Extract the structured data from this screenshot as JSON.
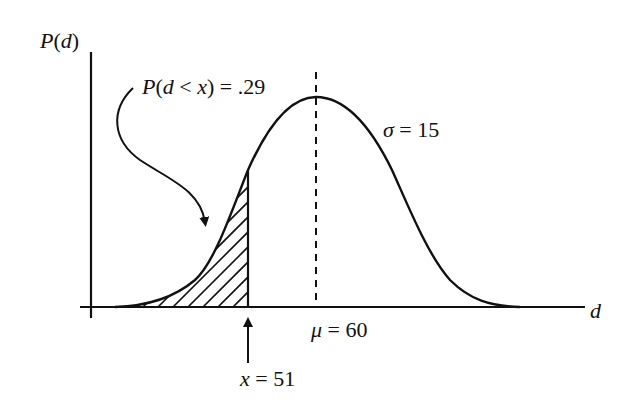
{
  "diagram": {
    "type": "normal-distribution",
    "y_axis_label": {
      "fn": "P",
      "open": "(",
      "var": "d",
      "close": ")"
    },
    "x_axis_label": "d",
    "annotation": {
      "fn": "P",
      "open": "(",
      "var": "d",
      "op": " < ",
      "x": "x",
      "close": ")",
      "eq": " = .29"
    },
    "sigma_label": {
      "sym": "σ",
      "eq": " = 15"
    },
    "mu_label": {
      "sym": "μ",
      "eq": " = 60"
    },
    "x_marker_label": {
      "sym": "x",
      "eq": " = 51"
    },
    "params": {
      "mean": 60,
      "sd": 15,
      "x": 51,
      "probability": 0.29
    },
    "colors": {
      "ink": "#111111",
      "background": "#ffffff"
    }
  }
}
